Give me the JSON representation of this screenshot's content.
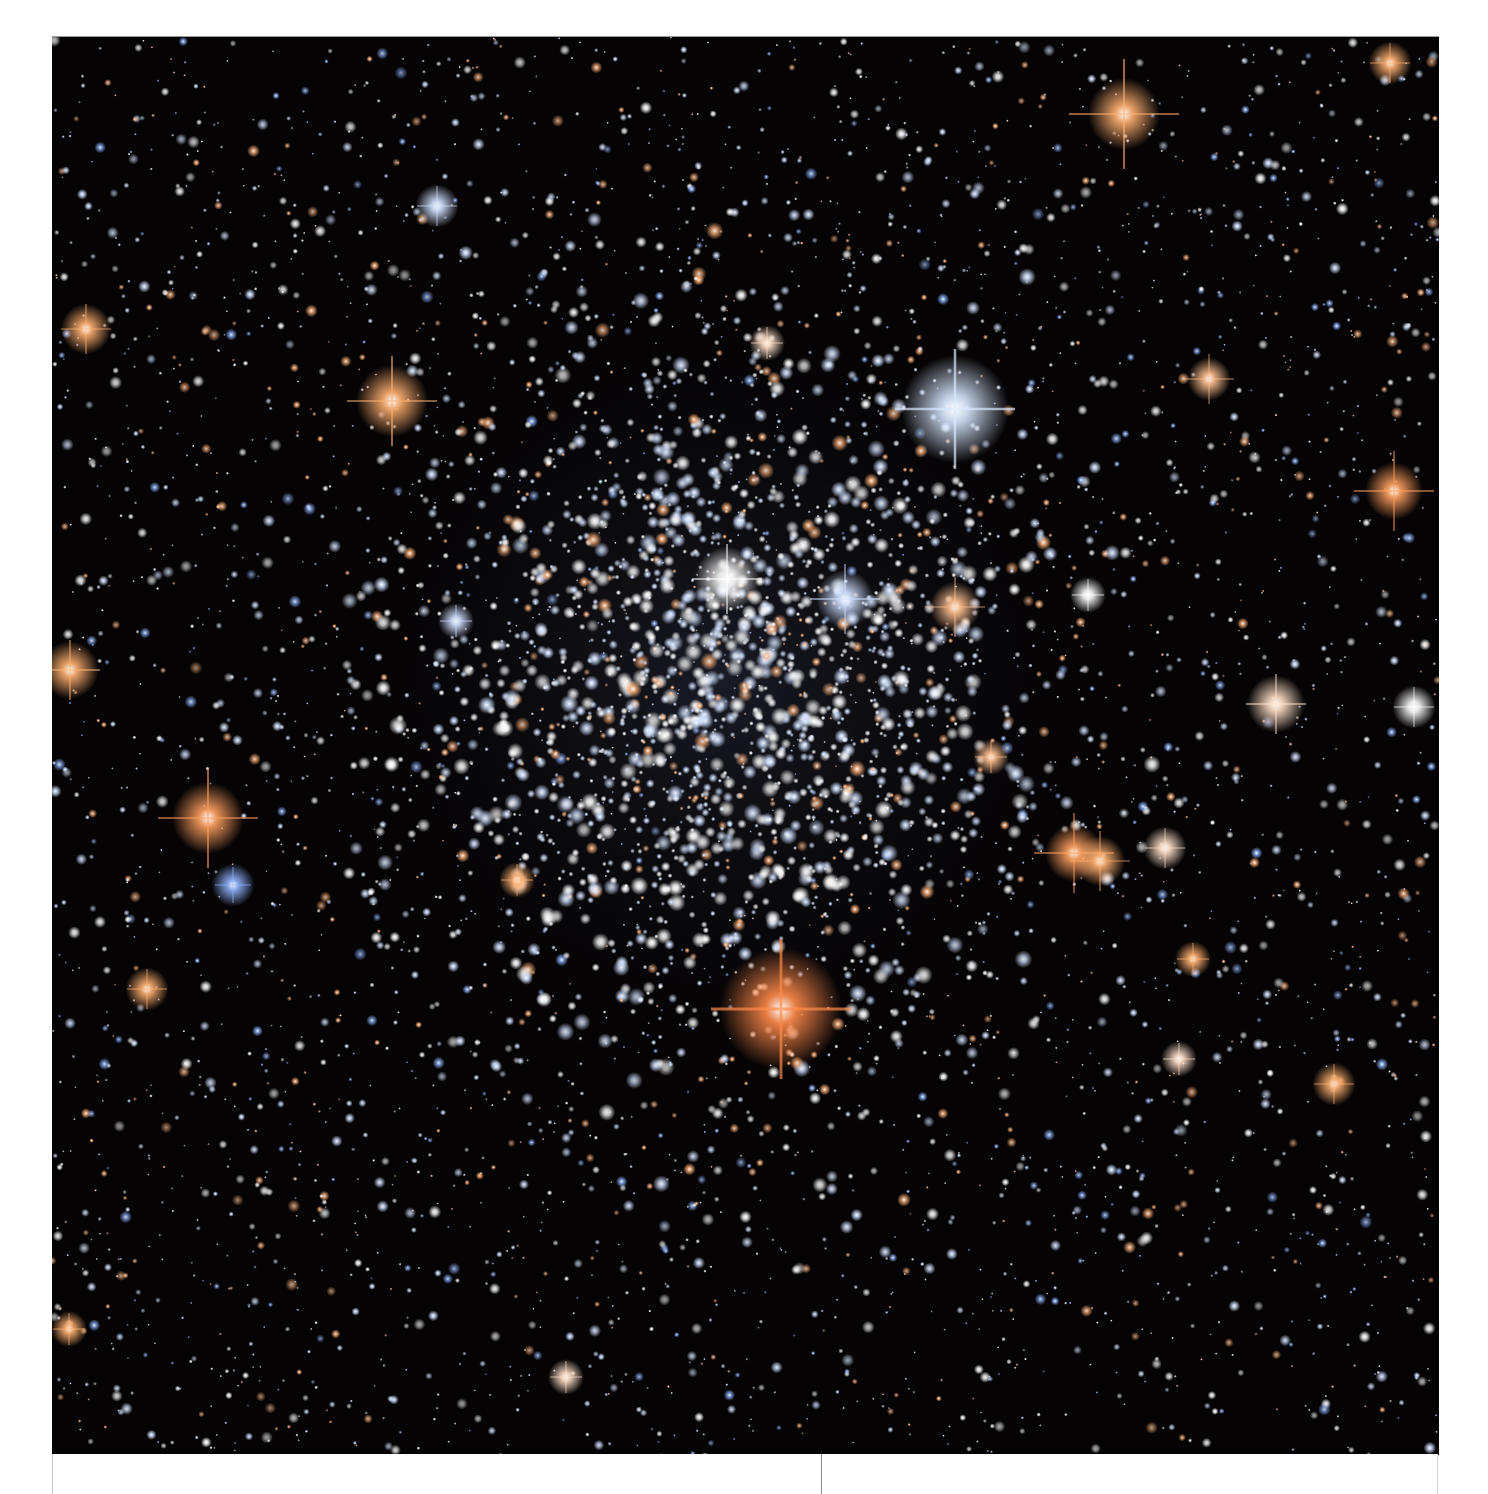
{
  "image": {
    "subject": "globular star cluster",
    "description": "Dense cluster of blue-white stars centered in frame with scattered orange/red giant stars showing diffraction spikes on a black background",
    "frame": {
      "left": 52,
      "top": 36,
      "width": 1387,
      "height": 1418
    },
    "background_color": "#050304",
    "page_color": "#ffffff",
    "cluster_center": {
      "x": 720,
      "y": 680
    },
    "cluster_radius": 380,
    "star_colors": {
      "blue_white": "#cfe0ff",
      "white": "#ffffff",
      "orange": "#ffb27a",
      "red_giant": "#ff7a3a",
      "blue": "#8fb4ff"
    },
    "bright_stars": [
      {
        "x": 781,
        "y": 1008,
        "size": 34,
        "color": "#ff8a4a",
        "spike": 70,
        "label": "red-giant-bottom"
      },
      {
        "x": 955,
        "y": 408,
        "size": 30,
        "color": "#d8e8ff",
        "spike": 60,
        "label": "blue-giant-upper-right"
      },
      {
        "x": 392,
        "y": 400,
        "size": 20,
        "color": "#ffb070",
        "spike": 45
      },
      {
        "x": 208,
        "y": 817,
        "size": 20,
        "color": "#ffa060",
        "spike": 50
      },
      {
        "x": 1124,
        "y": 113,
        "size": 20,
        "color": "#ffb070",
        "spike": 55
      },
      {
        "x": 1394,
        "y": 490,
        "size": 16,
        "color": "#ffa060",
        "spike": 40
      },
      {
        "x": 1074,
        "y": 852,
        "size": 16,
        "color": "#ffa060",
        "spike": 40
      },
      {
        "x": 1100,
        "y": 860,
        "size": 14,
        "color": "#ffb070",
        "spike": 30
      },
      {
        "x": 727,
        "y": 578,
        "size": 18,
        "color": "#ffffff",
        "spike": 35
      },
      {
        "x": 845,
        "y": 598,
        "size": 16,
        "color": "#cfe0ff",
        "spike": 35
      },
      {
        "x": 955,
        "y": 606,
        "size": 14,
        "color": "#ffc090",
        "spike": 30
      },
      {
        "x": 70,
        "y": 669,
        "size": 16,
        "color": "#ffb070",
        "spike": 30
      },
      {
        "x": 86,
        "y": 328,
        "size": 14,
        "color": "#ffb070",
        "spike": 25
      },
      {
        "x": 1276,
        "y": 703,
        "size": 16,
        "color": "#ffe0c8",
        "spike": 30
      },
      {
        "x": 1414,
        "y": 706,
        "size": 12,
        "color": "#ffffff",
        "spike": 20
      },
      {
        "x": 1209,
        "y": 378,
        "size": 12,
        "color": "#ffc090",
        "spike": 25
      },
      {
        "x": 147,
        "y": 988,
        "size": 12,
        "color": "#ffb070",
        "spike": 20
      },
      {
        "x": 1334,
        "y": 1083,
        "size": 12,
        "color": "#ffb070",
        "spike": 20
      },
      {
        "x": 437,
        "y": 205,
        "size": 12,
        "color": "#cfe0ff",
        "spike": 20
      },
      {
        "x": 1390,
        "y": 62,
        "size": 12,
        "color": "#ffb070",
        "spike": 20
      },
      {
        "x": 233,
        "y": 884,
        "size": 12,
        "color": "#8fb4ff",
        "spike": 18
      },
      {
        "x": 1165,
        "y": 847,
        "size": 12,
        "color": "#ffe0c8",
        "spike": 20
      },
      {
        "x": 517,
        "y": 879,
        "size": 10,
        "color": "#ffb070",
        "spike": 16
      },
      {
        "x": 1193,
        "y": 958,
        "size": 10,
        "color": "#ffb070",
        "spike": 16
      },
      {
        "x": 1179,
        "y": 1058,
        "size": 10,
        "color": "#ffe0c8",
        "spike": 16
      },
      {
        "x": 69,
        "y": 1328,
        "size": 10,
        "color": "#ffb070",
        "spike": 16
      },
      {
        "x": 767,
        "y": 342,
        "size": 10,
        "color": "#ffe0c8",
        "spike": 16
      },
      {
        "x": 991,
        "y": 756,
        "size": 10,
        "color": "#ffc090",
        "spike": 16
      },
      {
        "x": 456,
        "y": 620,
        "size": 10,
        "color": "#cfe0ff",
        "spike": 16
      },
      {
        "x": 566,
        "y": 1376,
        "size": 10,
        "color": "#ffe0c8",
        "spike": 16
      },
      {
        "x": 1088,
        "y": 594,
        "size": 10,
        "color": "#ffffff",
        "spike": 16
      }
    ],
    "field_star_count": 4200,
    "cluster_star_count": 1900,
    "seed": 20240917
  },
  "layout": {
    "bottom_strip_divider_x": 820
  }
}
